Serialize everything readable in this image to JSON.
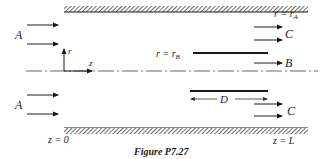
{
  "figure": {
    "caption": "Figure P7.27",
    "labels": {
      "inlet_top": "A",
      "inlet_bottom": "A",
      "outlet_top": "C",
      "outlet_center": "B",
      "outlet_bottom": "C",
      "outer_radius": "r = r",
      "outer_radius_sub": "A",
      "inner_radius": "r = r",
      "inner_radius_sub": "B",
      "axis_r": "r",
      "axis_z": "z",
      "tube_length": "D",
      "z_start": "z = 0",
      "z_end": "z = L"
    },
    "colors": {
      "ink": "#1a1a1a",
      "hatch": "#555555",
      "background": "#ffffff"
    }
  }
}
